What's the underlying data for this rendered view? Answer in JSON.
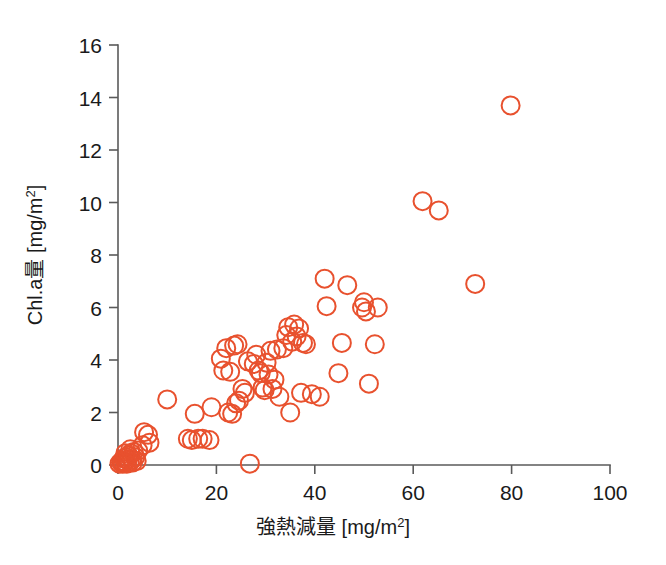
{
  "chart_data": {
    "type": "scatter",
    "title": "",
    "xlabel": "強熱減量 [mg/m²]",
    "ylabel": "Chl.a量 [mg/m²]",
    "xlabel_main": "強熱減量",
    "xlabel_unit": "[mg/m2]",
    "ylabel_main": "Chl.a量",
    "ylabel_unit": "[mg/m2]",
    "unit_base": "[mg/m",
    "unit_sup": "2",
    "unit_close": "]",
    "xlim": [
      0,
      100
    ],
    "ylim": [
      0,
      16
    ],
    "xticks": [
      0,
      20,
      40,
      60,
      80,
      100
    ],
    "yticks": [
      0,
      2,
      4,
      6,
      8,
      10,
      12,
      14,
      16
    ],
    "xtick_labels": [
      "0",
      "20",
      "40",
      "60",
      "80",
      "100"
    ],
    "ytick_labels": [
      "0",
      "2",
      "4",
      "6",
      "8",
      "10",
      "12",
      "14",
      "16"
    ],
    "grid": false,
    "legend": "none",
    "marker": {
      "shape": "open-circle",
      "color": "#e8512e",
      "radius_px": 9,
      "stroke_width_px": 2.0
    },
    "series": [
      {
        "name": "観測点",
        "color": "#e8512e",
        "points": [
          [
            0.3,
            0.05
          ],
          [
            0.6,
            0.1
          ],
          [
            0.8,
            0.15
          ],
          [
            1.0,
            0.05
          ],
          [
            1.2,
            0.25
          ],
          [
            1.4,
            0.1
          ],
          [
            1.6,
            0.3
          ],
          [
            1.8,
            0.05
          ],
          [
            2.0,
            0.2
          ],
          [
            2.2,
            0.35
          ],
          [
            2.4,
            0.1
          ],
          [
            2.6,
            0.45
          ],
          [
            2.8,
            0.2
          ],
          [
            3.0,
            0.1
          ],
          [
            3.2,
            0.5
          ],
          [
            3.5,
            0.3
          ],
          [
            3.8,
            0.15
          ],
          [
            4.1,
            0.55
          ],
          [
            2.5,
            0.6
          ],
          [
            1.5,
            0.45
          ],
          [
            5.0,
            0.75
          ],
          [
            5.3,
            1.25
          ],
          [
            6.1,
            1.15
          ],
          [
            6.4,
            0.85
          ],
          [
            10.0,
            2.5
          ],
          [
            14.2,
            1.0
          ],
          [
            15.0,
            0.95
          ],
          [
            15.6,
            1.95
          ],
          [
            16.3,
            1.0
          ],
          [
            17.2,
            1.0
          ],
          [
            18.6,
            0.95
          ],
          [
            19.0,
            2.2
          ],
          [
            20.9,
            4.05
          ],
          [
            21.4,
            3.6
          ],
          [
            22.0,
            4.45
          ],
          [
            22.4,
            2.0
          ],
          [
            22.8,
            3.55
          ],
          [
            23.2,
            1.95
          ],
          [
            23.6,
            4.55
          ],
          [
            24.0,
            2.35
          ],
          [
            24.3,
            4.6
          ],
          [
            24.6,
            2.45
          ],
          [
            25.3,
            2.9
          ],
          [
            25.8,
            2.75
          ],
          [
            26.4,
            3.95
          ],
          [
            26.8,
            0.05
          ],
          [
            27.6,
            3.85
          ],
          [
            28.1,
            4.2
          ],
          [
            28.6,
            3.6
          ],
          [
            29.0,
            3.5
          ],
          [
            29.4,
            2.95
          ],
          [
            29.8,
            2.85
          ],
          [
            30.2,
            3.9
          ],
          [
            30.6,
            3.45
          ],
          [
            31.0,
            4.35
          ],
          [
            31.4,
            2.9
          ],
          [
            31.8,
            3.25
          ],
          [
            32.3,
            4.4
          ],
          [
            32.8,
            2.6
          ],
          [
            33.6,
            4.45
          ],
          [
            34.2,
            4.95
          ],
          [
            34.6,
            5.25
          ],
          [
            35.0,
            2.0
          ],
          [
            35.4,
            4.7
          ],
          [
            35.8,
            5.35
          ],
          [
            36.3,
            4.9
          ],
          [
            36.8,
            5.2
          ],
          [
            37.2,
            2.75
          ],
          [
            37.6,
            4.65
          ],
          [
            38.2,
            4.6
          ],
          [
            39.4,
            2.7
          ],
          [
            41.0,
            2.6
          ],
          [
            42.0,
            7.1
          ],
          [
            42.4,
            6.05
          ],
          [
            44.8,
            3.5
          ],
          [
            45.5,
            4.65
          ],
          [
            46.6,
            6.85
          ],
          [
            49.6,
            6.0
          ],
          [
            50.0,
            6.2
          ],
          [
            50.4,
            5.85
          ],
          [
            51.0,
            3.1
          ],
          [
            52.2,
            4.6
          ],
          [
            52.8,
            6.0
          ],
          [
            61.9,
            10.05
          ],
          [
            65.2,
            9.7
          ],
          [
            72.6,
            6.9
          ],
          [
            79.8,
            13.7
          ]
        ]
      }
    ]
  }
}
